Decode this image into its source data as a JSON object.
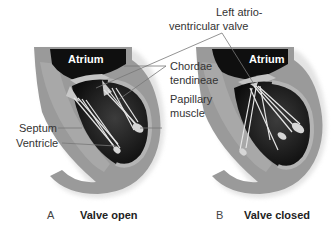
{
  "figure": {
    "panels": [
      {
        "id": "A",
        "letter": "A",
        "title": "Valve open",
        "atrium_label": "Atrium"
      },
      {
        "id": "B",
        "letter": "B",
        "title": "Valve closed",
        "atrium_label": "Atrium"
      }
    ],
    "labels": {
      "left_av_valve_line1": "Left atrio-",
      "left_av_valve_line2": "ventricular valve",
      "chordae_line1": "Chordae",
      "chordae_line2": "tendineae",
      "papillary_line1": "Papillary",
      "papillary_line2": "muscle",
      "septum": "Septum",
      "ventricle": "Ventricle"
    },
    "colors": {
      "wall": "#9a9a9a",
      "wall_light": "#b8b8b8",
      "chamber": "#111111",
      "chamber_grad": "#3a3a3a",
      "chordae": "#e8e8e8",
      "leader": "#777777"
    }
  }
}
